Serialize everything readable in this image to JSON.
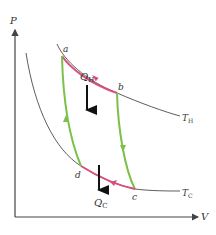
{
  "diagram": {
    "axes": {
      "y_label": "P",
      "x_label": "V"
    },
    "points": [
      {
        "label": "a"
      },
      {
        "label": "b"
      },
      {
        "label": "c"
      },
      {
        "label": "d"
      }
    ],
    "isotherms": [
      {
        "label_main": "T",
        "label_sub": "H"
      },
      {
        "label_main": "T",
        "label_sub": "C"
      }
    ],
    "heat_flows": [
      {
        "label_main": "Q",
        "label_sub": "H"
      },
      {
        "label_main": "Q",
        "label_sub": "C"
      }
    ],
    "colors": {
      "isotherm_process": "#d94f7c",
      "adiabat_process": "#7cbf4a",
      "isotherm_line": "#333333",
      "axis": "#444444",
      "arrow": "#111111"
    }
  }
}
